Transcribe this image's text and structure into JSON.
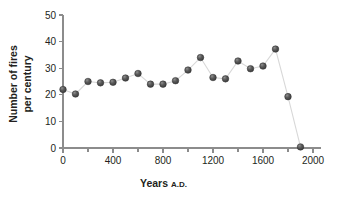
{
  "figure": {
    "top_caption": "",
    "marker_color": "#4d4d4d",
    "line_color": "#d8d8d8",
    "axis_color": "#8c8c8c",
    "text_color": "#231f20"
  },
  "chart_data": {
    "type": "scatter",
    "title": "",
    "xlabel": "Years",
    "xlabel_suffix": "A.D.",
    "ylabel_line1": "Number of fires",
    "ylabel_line2": "per century",
    "xlim": [
      0,
      2000
    ],
    "ylim": [
      0,
      50
    ],
    "grid": false,
    "legend": false,
    "xticks": [
      0,
      400,
      800,
      1200,
      1600,
      2000
    ],
    "xticklabels": [
      "0",
      "400",
      "800",
      "1200",
      "1600",
      "2000"
    ],
    "xminorticks": [
      200,
      600,
      1000,
      1400,
      1800
    ],
    "yticks": [
      0,
      10,
      20,
      30,
      40,
      50
    ],
    "yticklabels": [
      "0",
      "10",
      "20",
      "30",
      "40",
      "50"
    ],
    "x": [
      0,
      100,
      200,
      300,
      400,
      500,
      600,
      700,
      800,
      900,
      1000,
      1100,
      1200,
      1300,
      1400,
      1500,
      1600,
      1700,
      1800,
      1900
    ],
    "values": [
      22,
      20.3,
      25,
      24.5,
      24.7,
      26.3,
      28,
      24,
      24,
      25.3,
      29.3,
      34,
      26.5,
      26,
      32.7,
      29.8,
      30.8,
      37.2,
      19.3,
      0.4
    ],
    "series": [
      {
        "name": "Number of fires per century",
        "values": [
          22,
          20.3,
          25,
          24.5,
          24.7,
          26.3,
          28,
          24,
          24,
          25.3,
          29.3,
          34,
          26.5,
          26,
          32.7,
          29.8,
          30.8,
          37.2,
          19.3,
          0.4
        ]
      }
    ]
  }
}
